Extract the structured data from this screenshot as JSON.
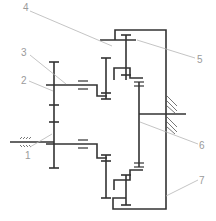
{
  "diagram": {
    "type": "planetary gear train schematic",
    "labels": [
      {
        "id": "1",
        "text": "1",
        "x": 26,
        "y": 156
      },
      {
        "id": "2",
        "text": "2",
        "x": 23,
        "y": 83
      },
      {
        "id": "3",
        "text": "3",
        "x": 23,
        "y": 55
      },
      {
        "id": "4",
        "text": "4",
        "x": 24,
        "y": 11
      },
      {
        "id": "5",
        "text": "5",
        "x": 198,
        "y": 62
      },
      {
        "id": "6",
        "text": "6",
        "x": 202,
        "y": 147
      },
      {
        "id": "7",
        "text": "7",
        "x": 200,
        "y": 184
      }
    ],
    "colors": {
      "line": "#333333",
      "leader": "#b5b5b5",
      "label": "#9a9a9a"
    }
  }
}
